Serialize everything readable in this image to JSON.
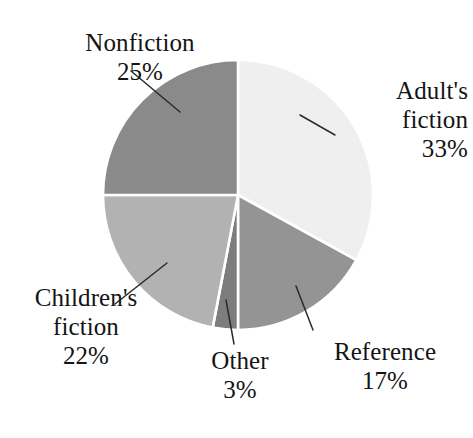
{
  "chart_data": {
    "type": "pie",
    "title": "",
    "subtitle": "",
    "xlabel": "",
    "ylabel": "",
    "legend_position": "none",
    "grid": false,
    "labels_outside_with_leader_lines": true,
    "start_angle_deg": 0,
    "direction": "clockwise",
    "categories": [
      "Adult's fiction",
      "Reference",
      "Other",
      "Children's fiction",
      "Nonfiction"
    ],
    "values": [
      33,
      17,
      3,
      22,
      25
    ],
    "value_unit": "%",
    "slices": [
      {
        "name": "Adult's fiction",
        "label_line1": "Adult's",
        "label_line2": "fiction",
        "value": 33,
        "value_text": "33%",
        "color": "#efefef",
        "start_deg": 0,
        "end_deg": 118.8
      },
      {
        "name": "Reference",
        "label_line1": "Reference",
        "label_line2": "",
        "value": 17,
        "value_text": "17%",
        "color": "#949494",
        "start_deg": 118.8,
        "end_deg": 180
      },
      {
        "name": "Other",
        "label_line1": "Other",
        "label_line2": "",
        "value": 3,
        "value_text": "3%",
        "color": "#7d7d7d",
        "start_deg": 180,
        "end_deg": 190.8
      },
      {
        "name": "Children's fiction",
        "label_line1": "Children's",
        "label_line2": "fiction",
        "value": 22,
        "value_text": "22%",
        "color": "#b2b2b2",
        "start_deg": 190.8,
        "end_deg": 270
      },
      {
        "name": "Nonfiction",
        "label_line1": "Nonfiction",
        "label_line2": "",
        "value": 25,
        "value_text": "25%",
        "color": "#8a8a8a",
        "start_deg": 270,
        "end_deg": 360
      }
    ],
    "total": 100,
    "separator_color": "#ffffff",
    "leader_line_color": "#2b2b2b",
    "background_color": "#ffffff"
  }
}
